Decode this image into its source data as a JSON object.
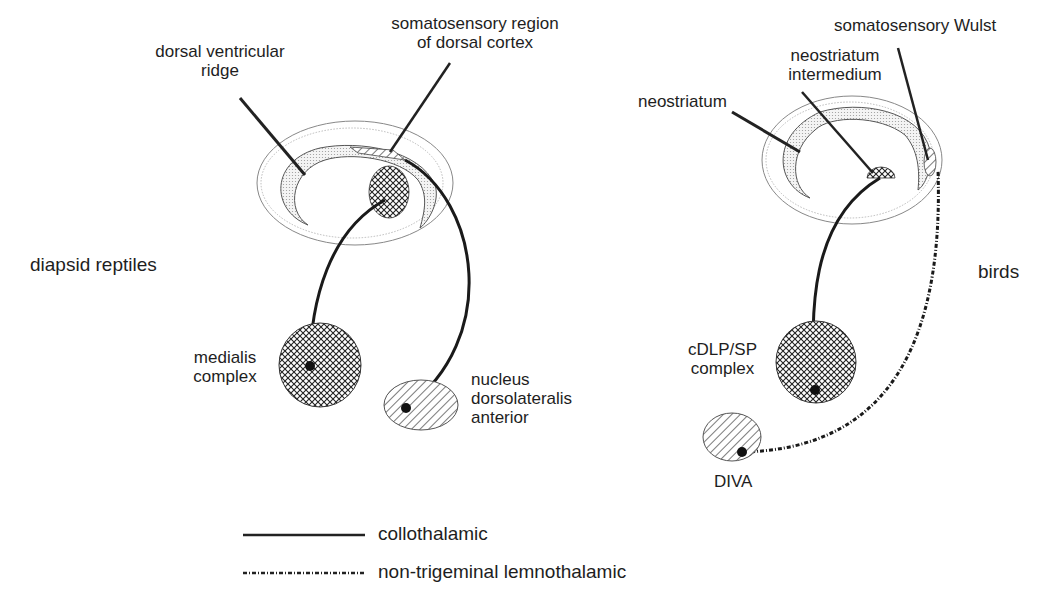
{
  "figure": {
    "panels": [
      {
        "title": "diapsid reptiles",
        "labels": {
          "dvr_line1": "dorsal ventricular",
          "dvr_line2": "ridge",
          "somato_line1": "somatosensory region",
          "somato_line2": "of dorsal cortex",
          "medialis_line1": "medialis",
          "medialis_line2": "complex",
          "ndla_line1": "nucleus",
          "ndla_line2": "dorsolateralis",
          "ndla_line3": "anterior"
        }
      },
      {
        "title": "birds",
        "labels": {
          "neostriatum": "neostriatum",
          "ni_line1": "neostriatum",
          "ni_line2": "intermedium",
          "wulst": "somatosensory Wulst",
          "cdlp_line1": "cDLP/SP",
          "cdlp_line2": "complex",
          "diva": "DIVA"
        }
      }
    ],
    "legend": [
      {
        "style": "solid",
        "label": "collothalamic"
      },
      {
        "style": "dashed",
        "label": "non-trigeminal lemnothalamic"
      }
    ]
  }
}
